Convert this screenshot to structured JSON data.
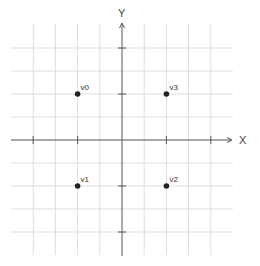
{
  "diagram": {
    "type": "coordinate-plane",
    "axes": {
      "x_label": "X",
      "y_label": "Y",
      "origin_px": [
        122,
        140
      ],
      "unit_px": [
        22.2,
        23.0
      ],
      "x_ticks": [
        -4,
        -2,
        2,
        4
      ],
      "y_ticks": [
        4,
        2,
        -2,
        -4
      ]
    },
    "grid": {
      "x_range": [
        -5,
        5
      ],
      "y_range": [
        -5,
        5
      ],
      "color": "#dddddd",
      "axis_color": "#555555"
    },
    "points": [
      {
        "label": "v0",
        "x": -2,
        "y": 2
      },
      {
        "label": "v1",
        "x": -2,
        "y": -2
      },
      {
        "label": "v2",
        "x": 2,
        "y": -2
      },
      {
        "label": "v3",
        "x": 2,
        "y": 2
      }
    ],
    "point_color": "#222222"
  }
}
